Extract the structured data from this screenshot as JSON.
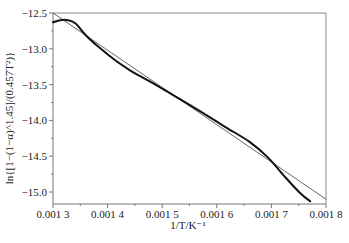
{
  "chart_data": {
    "type": "line",
    "title": "",
    "xlabel": "1/T/K⁻¹",
    "ylabel": "ln{[1−(1−α)^1.45]/(0.457T²)}",
    "xlim": [
      0.0013,
      0.0018
    ],
    "ylim": [
      -15.17,
      -12.5
    ],
    "x_ticks": [
      0.0013,
      0.0014,
      0.0015,
      0.0016,
      0.0017,
      0.0018
    ],
    "x_tick_labels": [
      "0.001 3",
      "0.001 4",
      "0.001 5",
      "0.001 6",
      "0.001 7",
      "0.001 8"
    ],
    "y_ticks": [
      -12.5,
      -13.0,
      -13.5,
      -14.0,
      -14.5,
      -15.0
    ],
    "y_tick_labels": [
      "−12.5",
      "−13.0",
      "−13.5",
      "−14.0",
      "−14.5",
      "−15.0"
    ],
    "grid": false,
    "legend": null,
    "series": [
      {
        "name": "experimental",
        "style": "thick-black",
        "x": [
          0.0013,
          0.001313,
          0.001327,
          0.001342,
          0.00136,
          0.001386,
          0.001414,
          0.001441,
          0.001478,
          0.001523,
          0.001569,
          0.001615,
          0.00166,
          0.001694,
          0.001725,
          0.001752,
          0.001771
        ],
        "y": [
          -12.63,
          -12.6,
          -12.6,
          -12.65,
          -12.81,
          -12.99,
          -13.16,
          -13.3,
          -13.46,
          -13.66,
          -13.87,
          -14.09,
          -14.3,
          -14.52,
          -14.79,
          -15.01,
          -15.13
        ]
      },
      {
        "name": "linear-fit",
        "style": "thin-gray",
        "x": [
          0.0013,
          0.0018
        ],
        "y": [
          -12.5,
          -15.1
        ]
      }
    ]
  },
  "colors": {
    "curve": "#111111",
    "fit_line": "#555555",
    "axis": "#777777",
    "text": "#222222"
  }
}
